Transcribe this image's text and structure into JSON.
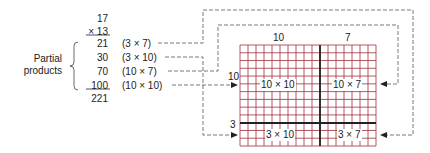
{
  "multiplication": {
    "multiplicand": "17",
    "multiplier": "× 13",
    "partial_label_line1": "Partial",
    "partial_label_line2": "products",
    "rows": [
      {
        "value": "21",
        "expr": "(3 × 7)"
      },
      {
        "value": "30",
        "expr": "(3 × 10)"
      },
      {
        "value": "70",
        "expr": "(10 × 7)"
      },
      {
        "value": "100",
        "expr": "(10 × 10)"
      }
    ],
    "total": "221"
  },
  "grid": {
    "top_labels": [
      "10",
      "7"
    ],
    "side_labels": [
      "10",
      "3"
    ],
    "regions": [
      "10 × 10",
      "10 × 7",
      "3 × 10",
      "3 × 7"
    ],
    "columns": 17,
    "rows": 13,
    "line_color": "#a0303a"
  }
}
